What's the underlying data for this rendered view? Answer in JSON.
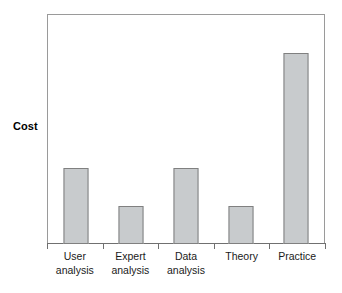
{
  "chart_data": {
    "type": "bar",
    "title": "",
    "subtitle": "",
    "xlabel": "",
    "ylabel": "Cost",
    "categories": [
      "User analysis",
      "Expert analysis",
      "Data analysis",
      "Theory",
      "Practice"
    ],
    "category_lines": [
      [
        "User",
        "analysis"
      ],
      [
        "Expert",
        "analysis"
      ],
      [
        "Data",
        "analysis"
      ],
      [
        "Theory"
      ],
      [
        "Practice"
      ]
    ],
    "values": [
      40,
      20,
      40,
      20,
      100
    ],
    "ylim": [
      0,
      120
    ],
    "grid": false,
    "legend": null,
    "y_tick_labels": [],
    "x_tick_marks": 6,
    "annotations": [],
    "colors": {
      "bar_fill": "#c8cbcd",
      "bar_border": "#808080",
      "frame": "#9a9a9a",
      "axis": "#707070",
      "text": "#1a1a1a",
      "background": "#ffffff"
    }
  },
  "axis": {
    "y_title": "Cost"
  }
}
